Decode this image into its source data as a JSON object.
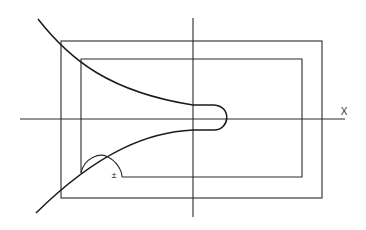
{
  "diagram": {
    "title": "",
    "axes": {
      "x_label": "X",
      "y_label": ""
    },
    "labels": {
      "plus_minus": "±"
    },
    "colors": {
      "line": "#2a2a2a",
      "curve": "#1a1a1a",
      "background": "#ffffff"
    },
    "elements": [
      "outer rectangle",
      "inner rectangle with notch at lower-left",
      "vertical axis",
      "horizontal axis X",
      "upper branch curve",
      "lower branch curve",
      "bulb closing the branches right of vertical axis",
      "small semicircular arc at lower-left corner"
    ]
  }
}
